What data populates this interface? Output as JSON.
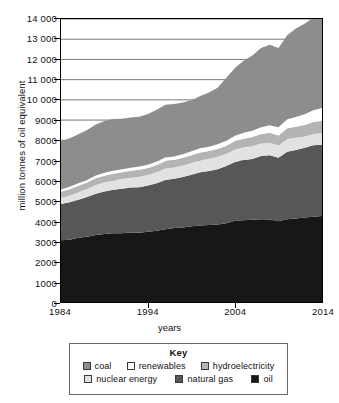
{
  "chart_data": {
    "type": "area",
    "title": "",
    "subtitle": "",
    "xlabel": "years",
    "ylabel": "million tonnes of oil equivalent",
    "xlim": [
      1984,
      2014
    ],
    "ylim": [
      0,
      14000
    ],
    "grid": true,
    "stacked": true,
    "legend_position": "below-chart",
    "legend_title": "Key",
    "x_ticks": [
      "1984",
      "1994",
      "2004",
      "2014"
    ],
    "x_tick_values": [
      1984,
      1994,
      2004,
      2014
    ],
    "y_ticks": [
      "0",
      "1000",
      "2000",
      "3000",
      "4000",
      "5000",
      "6000",
      "7000",
      "8000",
      "9000",
      "10 000",
      "11 000",
      "12 000",
      "13 000",
      "14 000"
    ],
    "y_tick_values": [
      0,
      1000,
      2000,
      3000,
      4000,
      5000,
      6000,
      7000,
      8000,
      9000,
      10000,
      11000,
      12000,
      13000,
      14000
    ],
    "x": [
      1984,
      1985,
      1986,
      1987,
      1988,
      1989,
      1990,
      1991,
      1992,
      1993,
      1994,
      1995,
      1996,
      1997,
      1998,
      1999,
      2000,
      2001,
      2002,
      2003,
      2004,
      2005,
      2006,
      2007,
      2008,
      2009,
      2010,
      2011,
      2012,
      2013,
      2014
    ],
    "stack_order_bottom_to_top": [
      "oil",
      "natural gas",
      "nuclear energy",
      "hydroelectricity",
      "renewables",
      "coal"
    ],
    "series": [
      {
        "name": "oil",
        "color": "#171717",
        "values": [
          3050,
          3080,
          3180,
          3230,
          3320,
          3370,
          3400,
          3400,
          3440,
          3430,
          3480,
          3530,
          3600,
          3660,
          3680,
          3750,
          3790,
          3810,
          3830,
          3900,
          4020,
          4050,
          4070,
          4100,
          4080,
          4000,
          4100,
          4130,
          4180,
          4220,
          4250
        ]
      },
      {
        "name": "natural gas",
        "color": "#575757",
        "values": [
          1800,
          1850,
          1880,
          1960,
          2030,
          2100,
          2150,
          2200,
          2220,
          2250,
          2280,
          2350,
          2440,
          2440,
          2500,
          2540,
          2630,
          2670,
          2740,
          2830,
          2900,
          2970,
          3010,
          3120,
          3180,
          3130,
          3330,
          3390,
          3450,
          3530,
          3530
        ]
      },
      {
        "name": "nuclear energy",
        "color": "#e2e2e2",
        "values": [
          300,
          340,
          370,
          400,
          440,
          450,
          460,
          480,
          490,
          510,
          520,
          540,
          560,
          550,
          570,
          590,
          590,
          600,
          610,
          600,
          620,
          630,
          630,
          620,
          620,
          610,
          630,
          600,
          560,
          560,
          570
        ]
      },
      {
        "name": "hydroelectricity",
        "color": "#b4b4b4",
        "values": [
          300,
          310,
          320,
          320,
          330,
          330,
          340,
          340,
          340,
          350,
          350,
          360,
          370,
          370,
          380,
          380,
          390,
          390,
          390,
          400,
          420,
          430,
          450,
          470,
          490,
          500,
          540,
          550,
          570,
          600,
          620
        ]
      },
      {
        "name": "renewables",
        "color": "#ffffff",
        "values": [
          120,
          120,
          125,
          130,
          135,
          140,
          145,
          150,
          155,
          160,
          165,
          170,
          175,
          180,
          185,
          195,
          205,
          215,
          230,
          250,
          270,
          290,
          310,
          340,
          370,
          400,
          440,
          480,
          530,
          580,
          630
        ]
      },
      {
        "name": "coal",
        "color": "#8d8d8d",
        "values": [
          2380,
          2400,
          2420,
          2470,
          2520,
          2560,
          2560,
          2500,
          2480,
          2470,
          2500,
          2560,
          2610,
          2600,
          2560,
          2530,
          2590,
          2680,
          2800,
          3120,
          3350,
          3570,
          3730,
          3920,
          3990,
          3920,
          4150,
          4380,
          4470,
          4580,
          4620
        ]
      }
    ],
    "cumulative_tops_2014": {
      "oil": 4250,
      "natural gas": 7780,
      "nuclear energy": 8350,
      "hydroelectricity": 8970,
      "renewables": 9600,
      "coal": 12900
    },
    "total_1984": 7950,
    "total_2014": 12900
  },
  "legend": {
    "title": "Key",
    "rows": [
      [
        {
          "label": "coal",
          "color": "#8d8d8d"
        },
        {
          "label": "renewables",
          "color": "#ffffff"
        },
        {
          "label": "hydroelectricity",
          "color": "#b4b4b4"
        }
      ],
      [
        {
          "label": "nuclear energy",
          "color": "#e2e2e2"
        },
        {
          "label": "natural gas",
          "color": "#575757"
        },
        {
          "label": "oil",
          "color": "#171717"
        }
      ]
    ]
  }
}
